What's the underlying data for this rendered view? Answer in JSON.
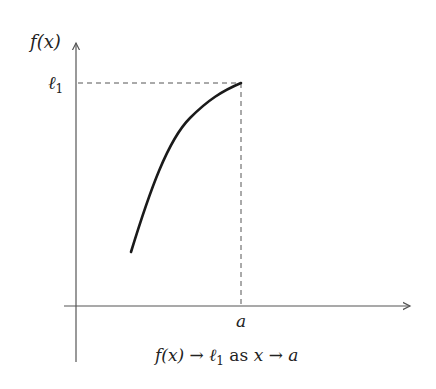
{
  "diagram": {
    "y_axis_label": "f(x)",
    "limit_label": "ℓ",
    "limit_subscript": "1",
    "x_point_label": "a",
    "caption": {
      "lhs": "f(x)",
      "arrow1": "→",
      "limit": "ℓ",
      "limit_sub": "1",
      "as": "as",
      "var": "x",
      "arrow2": "→",
      "target": "a"
    },
    "colors": {
      "axis": "#555555",
      "curve": "#1a1a1a",
      "dash": "#555555",
      "text": "#222222"
    }
  }
}
